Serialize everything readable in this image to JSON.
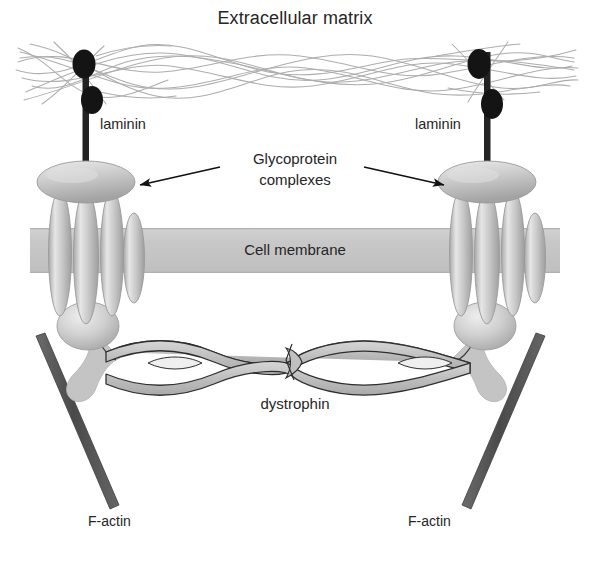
{
  "figure": {
    "type": "biology-diagram",
    "canvas": {
      "width": 590,
      "height": 561,
      "background": "#ffffff"
    }
  },
  "labels": {
    "title": "Extracellular matrix",
    "laminin_left": "laminin",
    "laminin_right": "laminin",
    "glycoprotein_line1": "Glycoprotein",
    "glycoprotein_line2": "complexes",
    "cell_membrane": "Cell membrane",
    "dystrophin": "dystrophin",
    "factin_left": "F-actin",
    "factin_right": "F-actin"
  },
  "colors": {
    "background": "#ffffff",
    "text": "#262626",
    "membrane_band": "#c9c9c9",
    "membrane_edge": "#b4b4b4",
    "protein_fill": "#bfbfbf",
    "protein_light": "#e3e3e3",
    "protein_outline": "#9a9a9a",
    "laminin_dark": "#1a1a1a",
    "ecm_fiber": "#a9a9a9",
    "factin": "#555555",
    "arrow": "#111111",
    "dystrophin_fill": "#bdbdbd",
    "dystrophin_outline": "#2e2e2e"
  },
  "structures": {
    "ecm_fibers": {
      "name": "extracellular-matrix-fiber-network",
      "count": 14,
      "band_top": 40,
      "band_bottom": 105,
      "stroke_width": 1
    },
    "laminin": [
      {
        "side": "left",
        "rod_x": 86,
        "rod_top": 52,
        "rod_bottom": 176,
        "beads": [
          {
            "cx": 84,
            "cy": 64,
            "rx": 11,
            "ry": 14,
            "offset": "left"
          },
          {
            "cx": 92,
            "cy": 100,
            "rx": 11,
            "ry": 14,
            "offset": "right"
          }
        ]
      },
      {
        "side": "right",
        "rod_x": 487,
        "rod_top": 52,
        "rod_bottom": 176,
        "beads": [
          {
            "cx": 479,
            "cy": 64,
            "rx": 11,
            "ry": 14,
            "offset": "left"
          },
          {
            "cx": 492,
            "cy": 104,
            "rx": 11,
            "ry": 15,
            "offset": "right"
          }
        ]
      }
    ],
    "glycoprotein_complexes": [
      {
        "side": "left",
        "center_x": 86,
        "cap_disc": {
          "cx": 86,
          "cy": 182,
          "rx": 48,
          "ry": 20
        },
        "transmembrane_rods": [
          {
            "cx": 60,
            "cy": 253,
            "rx": 11,
            "ry": 62
          },
          {
            "cx": 85,
            "cy": 256,
            "rx": 12,
            "ry": 66
          },
          {
            "cx": 110,
            "cy": 253,
            "rx": 11,
            "ry": 62
          }
        ],
        "side_rod": {
          "cx": 134,
          "cy": 258,
          "rx": 10,
          "ry": 44
        },
        "basal_blob": {
          "cx": 88,
          "cy": 326,
          "rx": 30,
          "ry": 23
        }
      },
      {
        "side": "right",
        "center_x": 487,
        "cap_disc": {
          "cx": 487,
          "cy": 182,
          "rx": 48,
          "ry": 20
        },
        "transmembrane_rods": [
          {
            "cx": 461,
            "cy": 253,
            "rx": 11,
            "ry": 62
          },
          {
            "cx": 486,
            "cy": 256,
            "rx": 12,
            "ry": 66
          },
          {
            "cx": 511,
            "cy": 253,
            "rx": 11,
            "ry": 62
          }
        ],
        "side_rod": {
          "cx": 535,
          "cy": 258,
          "rx": 10,
          "ry": 44
        },
        "basal_blob": {
          "cx": 485,
          "cy": 326,
          "rx": 30,
          "ry": 23
        }
      }
    ],
    "cell_membrane": {
      "x": 30,
      "y": 228,
      "width": 530,
      "height": 45
    },
    "dystrophin": {
      "name": "dystrophin-coiled-coil",
      "x_start": 108,
      "x_end": 470,
      "center_y": 363,
      "amplitude": 15,
      "periods": 6,
      "has_central_kink": true
    },
    "f_actin": [
      {
        "side": "left",
        "x1": 36,
        "y1": 336,
        "x2": 110,
        "y2": 508,
        "width": 9
      },
      {
        "side": "right",
        "x1": 538,
        "y1": 336,
        "x2": 462,
        "y2": 508,
        "width": 9
      }
    ],
    "arrows": [
      {
        "name": "arrow-to-left-complex",
        "x1": 218,
        "y1": 168,
        "x2": 137,
        "y2": 186
      },
      {
        "name": "arrow-to-right-complex",
        "x1": 366,
        "y1": 168,
        "x2": 447,
        "y2": 186
      }
    ]
  }
}
